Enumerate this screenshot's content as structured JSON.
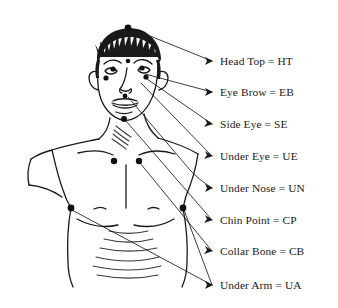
{
  "diagram": {
    "ink_color": "#1a1a1a",
    "background_color": "#ffffff",
    "point_marker_color": "#111111",
    "labels": [
      {
        "id": "HT",
        "name": "Head Top",
        "abbr": "HT",
        "text": "Head Top = HT",
        "label_y": 61,
        "arrow_tip_x": 213,
        "arrow_tip_y": 61
      },
      {
        "id": "EB",
        "name": "Eye Brow",
        "abbr": "EB",
        "text": "Eye Brow = EB",
        "label_y": 92,
        "arrow_tip_x": 213,
        "arrow_tip_y": 92
      },
      {
        "id": "SE",
        "name": "Side Eye",
        "abbr": "SE",
        "text": "Side Eye = SE",
        "label_y": 124,
        "arrow_tip_x": 213,
        "arrow_tip_y": 124
      },
      {
        "id": "UE",
        "name": "Under Eye",
        "abbr": "UE",
        "text": "Under Eye = UE",
        "label_y": 156,
        "arrow_tip_x": 213,
        "arrow_tip_y": 156
      },
      {
        "id": "UN",
        "name": "Under Nose",
        "abbr": "UN",
        "text": "Under Nose = UN",
        "label_y": 188,
        "arrow_tip_x": 213,
        "arrow_tip_y": 188
      },
      {
        "id": "CP",
        "name": "Chin Point",
        "abbr": "CP",
        "text": "Chin Point = CP",
        "label_y": 220,
        "arrow_tip_x": 213,
        "arrow_tip_y": 220
      },
      {
        "id": "CB",
        "name": "Collar Bone",
        "abbr": "CB",
        "text": "Collar Bone = CB",
        "label_y": 251,
        "arrow_tip_x": 213,
        "arrow_tip_y": 251
      },
      {
        "id": "UA",
        "name": "Under Arm",
        "abbr": "UA",
        "text": "Under Arm = UA",
        "label_y": 285,
        "arrow_tip_x": 213,
        "arrow_tip_y": 285
      }
    ],
    "marked_points": [
      {
        "id": "HT",
        "label": "Head Top",
        "x": 128,
        "y": 28,
        "r": 3.4
      },
      {
        "id": "EB-center",
        "label": "Eye Brow center",
        "x": 128,
        "y": 61,
        "r": 2.3
      },
      {
        "id": "EB-left",
        "label": "Eye Brow left",
        "x": 113,
        "y": 69,
        "r": 2.6
      },
      {
        "id": "EB-right",
        "label": "Eye Brow right",
        "x": 142,
        "y": 68,
        "r": 2.6
      },
      {
        "id": "SE-left",
        "label": "Side Eye left",
        "x": 106,
        "y": 78,
        "r": 2.6
      },
      {
        "id": "SE-right",
        "label": "Side Eye right",
        "x": 146,
        "y": 77,
        "r": 2.6
      },
      {
        "id": "UN",
        "label": "Under Nose",
        "x": 125,
        "y": 96,
        "r": 2.4
      },
      {
        "id": "CP",
        "label": "Chin Point",
        "x": 124,
        "y": 119,
        "r": 3.0
      },
      {
        "id": "CB-left",
        "label": "Collar Bone left",
        "x": 114,
        "y": 161,
        "r": 3.2
      },
      {
        "id": "CB-right",
        "label": "Collar Bone right",
        "x": 139,
        "y": 161,
        "r": 3.2
      },
      {
        "id": "UA-left",
        "label": "Under Arm left",
        "x": 71,
        "y": 208,
        "r": 3.4
      },
      {
        "id": "UA-right",
        "label": "Under Arm right",
        "x": 183,
        "y": 208,
        "r": 3.4
      }
    ]
  }
}
